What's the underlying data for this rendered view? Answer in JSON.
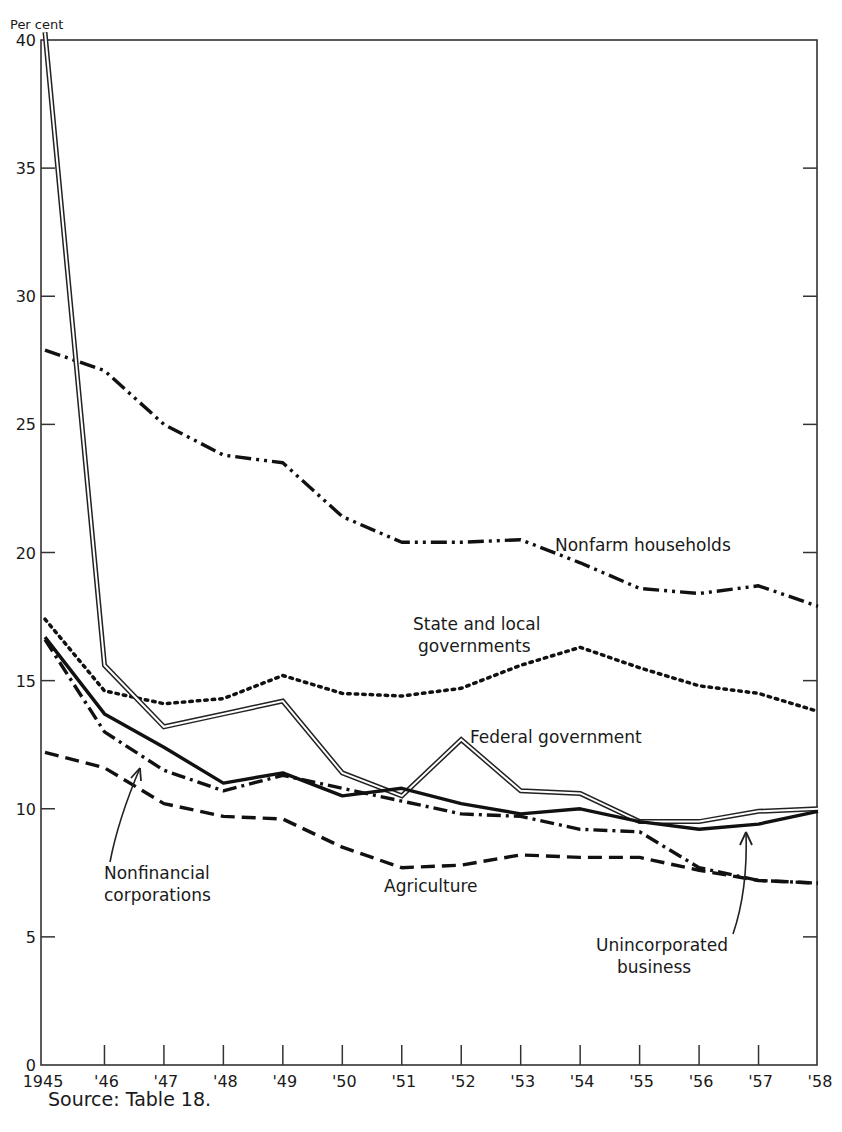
{
  "chart_data": {
    "type": "line",
    "title": "",
    "ylabel": "Per cent",
    "xlabel": "",
    "ylim": [
      0,
      40
    ],
    "yticks": [
      0,
      5,
      10,
      15,
      20,
      25,
      30,
      35,
      40
    ],
    "grid": false,
    "legend": "inline labels",
    "x": [
      1945,
      1946,
      1947,
      1948,
      1949,
      1950,
      1951,
      1952,
      1953,
      1954,
      1955,
      1956,
      1957,
      1958
    ],
    "xtick_labels": [
      "1945",
      "'46",
      "'47",
      "'48",
      "'49",
      "'50",
      "'51",
      "'52",
      "'53",
      "'54",
      "'55",
      "'56",
      "'57",
      "'58"
    ],
    "series": [
      {
        "name": "Nonfarm households",
        "style": "dash-dot-dot",
        "label_lines": [
          "Nonfarm households"
        ],
        "values": [
          27.9,
          27.1,
          25.0,
          23.8,
          23.5,
          21.4,
          20.4,
          20.4,
          20.5,
          19.6,
          18.6,
          18.4,
          18.7,
          17.9
        ]
      },
      {
        "name": "State and local governments",
        "style": "dotted",
        "label_lines": [
          "State and local",
          "governments"
        ],
        "values": [
          17.4,
          14.6,
          14.1,
          14.3,
          15.2,
          14.5,
          14.4,
          14.7,
          15.6,
          16.3,
          15.5,
          14.8,
          14.5,
          13.8
        ]
      },
      {
        "name": "Federal government",
        "style": "double",
        "label_lines": [
          "Federal government"
        ],
        "values": [
          40.3,
          15.6,
          13.2,
          13.7,
          14.2,
          11.4,
          10.5,
          12.7,
          10.7,
          10.6,
          9.5,
          9.5,
          9.9,
          10.0
        ]
      },
      {
        "name": "Unincorporated business",
        "style": "solid",
        "label_lines": [
          "Unincorporated",
          "business"
        ],
        "values": [
          16.7,
          13.7,
          12.4,
          11.0,
          11.4,
          10.5,
          10.8,
          10.2,
          9.8,
          10.0,
          9.5,
          9.2,
          9.4,
          9.9
        ]
      },
      {
        "name": "Nonfinancial corporations",
        "style": "dash-dot",
        "label_lines": [
          "Nonfinancial",
          "corporations"
        ],
        "values": [
          16.6,
          13.0,
          11.5,
          10.7,
          11.3,
          10.8,
          10.3,
          9.8,
          9.7,
          9.2,
          9.1,
          7.7,
          7.2,
          7.1
        ]
      },
      {
        "name": "Agriculture",
        "style": "dashed",
        "label_lines": [
          "Agriculture"
        ],
        "values": [
          12.2,
          11.6,
          10.2,
          9.7,
          9.6,
          8.5,
          7.7,
          7.8,
          8.2,
          8.1,
          8.1,
          7.6,
          7.2,
          7.1
        ]
      }
    ],
    "annotations": [
      "arrow from 'Nonfinancial corporations' label to dash-dot line near '47",
      "arrow from 'Unincorporated business' label to solid line near '57"
    ],
    "source": "Source: Table 18."
  },
  "axis": {
    "y_unit_label": "Per cent"
  },
  "footer": {
    "source": "Source: Table 18."
  }
}
